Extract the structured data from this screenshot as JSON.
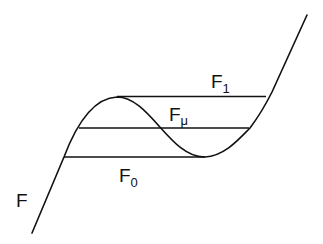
{
  "diagram": {
    "labels": {
      "curve": "F",
      "upper": {
        "base": "F",
        "sub": "1"
      },
      "middle": {
        "base": "F",
        "sub": "μ"
      },
      "lower": {
        "base": "F",
        "sub": "0"
      }
    },
    "stroke_color": "#111111",
    "background": "#ffffff"
  }
}
